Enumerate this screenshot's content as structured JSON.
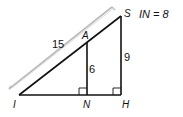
{
  "diagram": {
    "given": "IN = 8",
    "points": {
      "I": {
        "label": "I",
        "x": 19,
        "y": 95
      },
      "N": {
        "label": "N",
        "x": 87,
        "y": 95
      },
      "H": {
        "label": "H",
        "x": 121,
        "y": 95
      },
      "A": {
        "label": "A",
        "x": 87,
        "y": 43
      },
      "S": {
        "label": "S",
        "x": 121,
        "y": 16
      }
    },
    "measures": {
      "IS": "15",
      "AN": "6",
      "SH": "9"
    },
    "right_angles": [
      "ANI",
      "SHI"
    ],
    "colors": {
      "stroke": "#111111",
      "bracket": "#bbbbbb"
    }
  }
}
